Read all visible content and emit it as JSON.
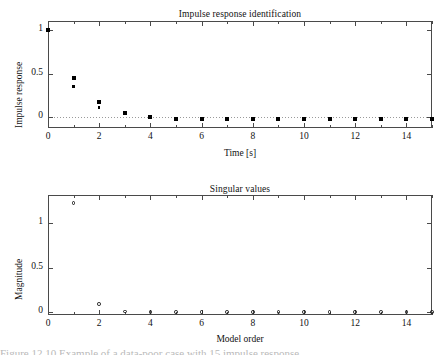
{
  "figure": {
    "caption_partial": "Figure   12.10   Example of a data-poor case with 15 impulse response"
  },
  "chart_data": [
    {
      "type": "scatter",
      "title": "Impulse response identification",
      "xlabel": "Time [s]",
      "ylabel": "Impulse response",
      "xlim": [
        0,
        15
      ],
      "ylim": [
        -0.12,
        1.1
      ],
      "grid": false,
      "legend": "none",
      "xticks": [
        0,
        2,
        4,
        6,
        8,
        10,
        12,
        14
      ],
      "xticklabels": [
        "0",
        "2",
        "4",
        "6",
        "8",
        "10",
        "12",
        "14"
      ],
      "xminorticks": [
        1,
        3,
        5,
        7,
        9,
        11,
        13,
        15
      ],
      "yticks": [
        0,
        0.5,
        1
      ],
      "yticklabels": [
        "0",
        "0.5",
        "1"
      ],
      "zero_reference_line": 0,
      "x": [
        0,
        1,
        2,
        3,
        4,
        5,
        6,
        7,
        8,
        9,
        10,
        11,
        12,
        13,
        14,
        15
      ],
      "series": [
        {
          "name": "true impulse response",
          "marker": "filled-square",
          "values": [
            1.0,
            0.45,
            0.18,
            0.055,
            0.01,
            -0.012,
            -0.015,
            -0.018,
            -0.015,
            -0.015,
            -0.015,
            -0.015,
            -0.015,
            -0.015,
            -0.015,
            -0.018
          ]
        },
        {
          "name": "estimated impulse response",
          "marker": "small-dot",
          "values": [
            1.0,
            0.35,
            0.115,
            0.04,
            0.005,
            -0.012,
            -0.015,
            -0.018,
            -0.015,
            -0.015,
            -0.015,
            -0.015,
            -0.015,
            -0.015,
            -0.015,
            -0.018
          ]
        }
      ]
    },
    {
      "type": "scatter",
      "title": "Singular values",
      "xlabel": "Model order",
      "ylabel": "Magnitude",
      "xlim": [
        0,
        15
      ],
      "ylim": [
        -0.03,
        1.31
      ],
      "grid": false,
      "legend": "none",
      "xticks": [
        0,
        2,
        4,
        6,
        8,
        10,
        12,
        14
      ],
      "xticklabels": [
        "0",
        "2",
        "4",
        "6",
        "8",
        "10",
        "12",
        "14"
      ],
      "xminorticks": [
        1,
        3,
        5,
        7,
        9,
        11,
        13,
        15
      ],
      "yticks": [
        0,
        0.5,
        1
      ],
      "yticklabels": [
        "0",
        "0.5",
        "1"
      ],
      "x": [
        1,
        2,
        3,
        4,
        5,
        6,
        7,
        8,
        9,
        10,
        11,
        12,
        13,
        14,
        15
      ],
      "series": [
        {
          "name": "singular values",
          "marker": "open-circle",
          "values": [
            1.22,
            0.09,
            0.008,
            0.006,
            0.005,
            0.005,
            0.004,
            0.004,
            0.004,
            0.004,
            0.003,
            0.003,
            0.003,
            0.003,
            0.003
          ]
        }
      ]
    }
  ]
}
